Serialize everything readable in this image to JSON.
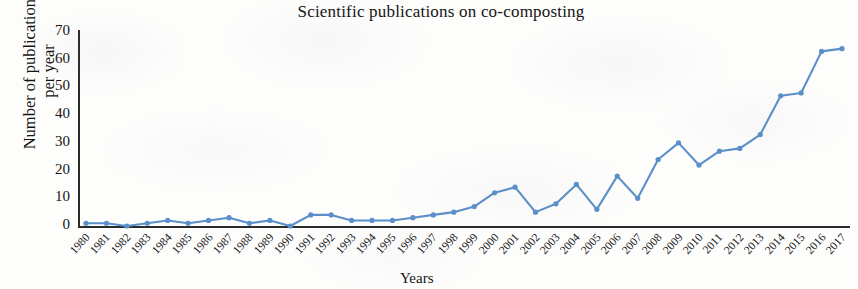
{
  "figure": {
    "title": "Scientific publications on co-composting",
    "x_axis_title": "Years",
    "y_axis_title_line1": "Number of publications",
    "y_axis_title_line2": "per year",
    "series_color": "#5B8FC9",
    "axis_color": "#2B2B2B",
    "background": "#FDFDFC"
  },
  "chart_data": {
    "type": "line",
    "title": "Scientific publications on co-composting",
    "xlabel": "Years",
    "ylabel": "Number of publications per year",
    "xlim": [
      1980,
      2017
    ],
    "ylim": [
      0,
      70
    ],
    "yticks": [
      0,
      10,
      20,
      30,
      40,
      50,
      60,
      70
    ],
    "grid": false,
    "legend": null,
    "marker": "diamond",
    "line_color": "#5B8FC9",
    "categories": [
      "1980",
      "1981",
      "1982",
      "1983",
      "1984",
      "1985",
      "1986",
      "1987",
      "1988",
      "1989",
      "1990",
      "1991",
      "1992",
      "1993",
      "1994",
      "1995",
      "1996",
      "1997",
      "1998",
      "1999",
      "2000",
      "2001",
      "2002",
      "2003",
      "2004",
      "2005",
      "2006",
      "2007",
      "2008",
      "2009",
      "2010",
      "2011",
      "2012",
      "2013",
      "2014",
      "2015",
      "2016",
      "2017"
    ],
    "x": [
      1980,
      1981,
      1982,
      1983,
      1984,
      1985,
      1986,
      1987,
      1988,
      1989,
      1990,
      1991,
      1992,
      1993,
      1994,
      1995,
      1996,
      1997,
      1998,
      1999,
      2000,
      2001,
      2002,
      2003,
      2004,
      2005,
      2006,
      2007,
      2008,
      2009,
      2010,
      2011,
      2012,
      2013,
      2014,
      2015,
      2016,
      2017
    ],
    "values": [
      1,
      1,
      0,
      1,
      2,
      1,
      2,
      3,
      1,
      2,
      0,
      4,
      4,
      2,
      2,
      2,
      3,
      4,
      5,
      7,
      12,
      14,
      5,
      8,
      15,
      6,
      18,
      10,
      24,
      30,
      22,
      27,
      28,
      33,
      47,
      48,
      63,
      64
    ],
    "series": [
      {
        "name": "Publications per year",
        "values": [
          1,
          1,
          0,
          1,
          2,
          1,
          2,
          3,
          1,
          2,
          0,
          4,
          4,
          2,
          2,
          2,
          3,
          4,
          5,
          7,
          12,
          14,
          5,
          8,
          15,
          6,
          18,
          10,
          24,
          30,
          22,
          27,
          28,
          33,
          47,
          48,
          63,
          64
        ]
      }
    ]
  }
}
